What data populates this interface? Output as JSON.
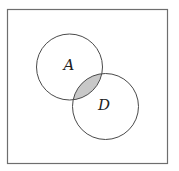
{
  "diagram": {
    "type": "venn",
    "universe": {
      "x": 7,
      "y": 9,
      "width": 160,
      "height": 154,
      "stroke": "#6e6e6e"
    },
    "sets": [
      {
        "label": "A",
        "cx": 69.5,
        "cy": 67,
        "r": 33
      },
      {
        "label": "D",
        "cx": 105.5,
        "cy": 106.5,
        "r": 33
      }
    ],
    "shaded_region": "A ∩ D",
    "colors": {
      "stroke": "#4a4a4a",
      "shade": "#c8c8c8",
      "background": "#ffffff"
    }
  }
}
